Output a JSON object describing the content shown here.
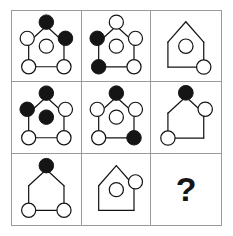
{
  "puzzle": {
    "type": "raven-progressive-matrix",
    "rows": 3,
    "columns": 3,
    "question_mark": "?",
    "colors": {
      "stroke": "#151515",
      "filled": "#151515",
      "empty": "#ffffff",
      "grid_line": "#9a9a9a",
      "background": "#ffffff"
    },
    "node_positions": {
      "apex": "top-center",
      "left_mid": "left-middle",
      "right_mid": "right-middle",
      "center": "center",
      "bottom_left": "bottom-left",
      "bottom_right": "bottom-right"
    },
    "cells": [
      {
        "index": 1,
        "row": 1,
        "col": 1,
        "label": "cell-r1c1",
        "shape": "house-frame",
        "frame_parts": [
          "roof-left",
          "roof-right",
          "wall-left",
          "wall-right",
          "floor"
        ],
        "nodes": {
          "apex": "filled",
          "left_mid": "empty",
          "right_mid": "filled",
          "center": "empty",
          "bottom_left": "empty",
          "bottom_right": "empty"
        }
      },
      {
        "index": 2,
        "row": 1,
        "col": 2,
        "label": "cell-r1c2",
        "shape": "house-frame",
        "frame_parts": [
          "roof-left",
          "roof-right",
          "wall-left",
          "wall-right",
          "floor"
        ],
        "nodes": {
          "apex": "empty",
          "left_mid": "filled",
          "right_mid": "empty",
          "center": "empty",
          "bottom_left": "filled",
          "bottom_right": "empty"
        }
      },
      {
        "index": 3,
        "row": 1,
        "col": 3,
        "label": "cell-r1c3",
        "shape": "house-outline",
        "frame_parts": [
          "roof-left",
          "roof-right",
          "wall-left",
          "wall-right",
          "floor"
        ],
        "nodes": {
          "apex": "none",
          "left_mid": "none",
          "right_mid": "none",
          "center": "empty",
          "bottom_left": "none",
          "bottom_right": "empty"
        }
      },
      {
        "index": 4,
        "row": 2,
        "col": 1,
        "label": "cell-r2c1",
        "shape": "house-frame",
        "frame_parts": [
          "roof-left",
          "roof-right",
          "wall-left",
          "wall-right",
          "floor"
        ],
        "nodes": {
          "apex": "filled",
          "left_mid": "filled",
          "right_mid": "empty",
          "center": "filled",
          "bottom_left": "empty",
          "bottom_right": "empty"
        }
      },
      {
        "index": 5,
        "row": 2,
        "col": 2,
        "label": "cell-r2c2",
        "shape": "house-frame",
        "frame_parts": [
          "roof-left",
          "roof-right",
          "wall-left",
          "wall-right",
          "floor"
        ],
        "nodes": {
          "apex": "filled",
          "left_mid": "empty",
          "right_mid": "empty",
          "center": "empty",
          "bottom_left": "empty",
          "bottom_right": "filled"
        }
      },
      {
        "index": 6,
        "row": 2,
        "col": 3,
        "label": "cell-r2c3",
        "shape": "house-outline",
        "frame_parts": [
          "roof-left",
          "roof-right",
          "wall-left",
          "wall-right",
          "floor"
        ],
        "nodes": {
          "apex": "filled",
          "left_mid": "none",
          "right_mid": "empty",
          "center": "none",
          "bottom_left": "empty",
          "bottom_right": "none"
        }
      },
      {
        "index": 7,
        "row": 3,
        "col": 1,
        "label": "cell-r3c1",
        "shape": "house-frame",
        "frame_parts": [
          "roof-left",
          "roof-right",
          "wall-left",
          "wall-right",
          "floor"
        ],
        "nodes": {
          "apex": "filled",
          "left_mid": "none",
          "right_mid": "none",
          "center": "none",
          "bottom_left": "empty",
          "bottom_right": "empty"
        }
      },
      {
        "index": 8,
        "row": 3,
        "col": 2,
        "label": "cell-r3c2",
        "shape": "house-outline",
        "frame_parts": [
          "roof-left",
          "roof-right",
          "wall-left",
          "wall-right",
          "floor"
        ],
        "nodes": {
          "apex": "none",
          "left_mid": "none",
          "right_mid": "empty",
          "center": "empty",
          "bottom_left": "none",
          "bottom_right": "none"
        }
      },
      {
        "index": 9,
        "row": 3,
        "col": 3,
        "label": "cell-r3c3-answer",
        "shape": "question",
        "frame_parts": [],
        "nodes": {
          "apex": "none",
          "left_mid": "none",
          "right_mid": "none",
          "center": "none",
          "bottom_left": "none",
          "bottom_right": "none"
        }
      }
    ]
  }
}
